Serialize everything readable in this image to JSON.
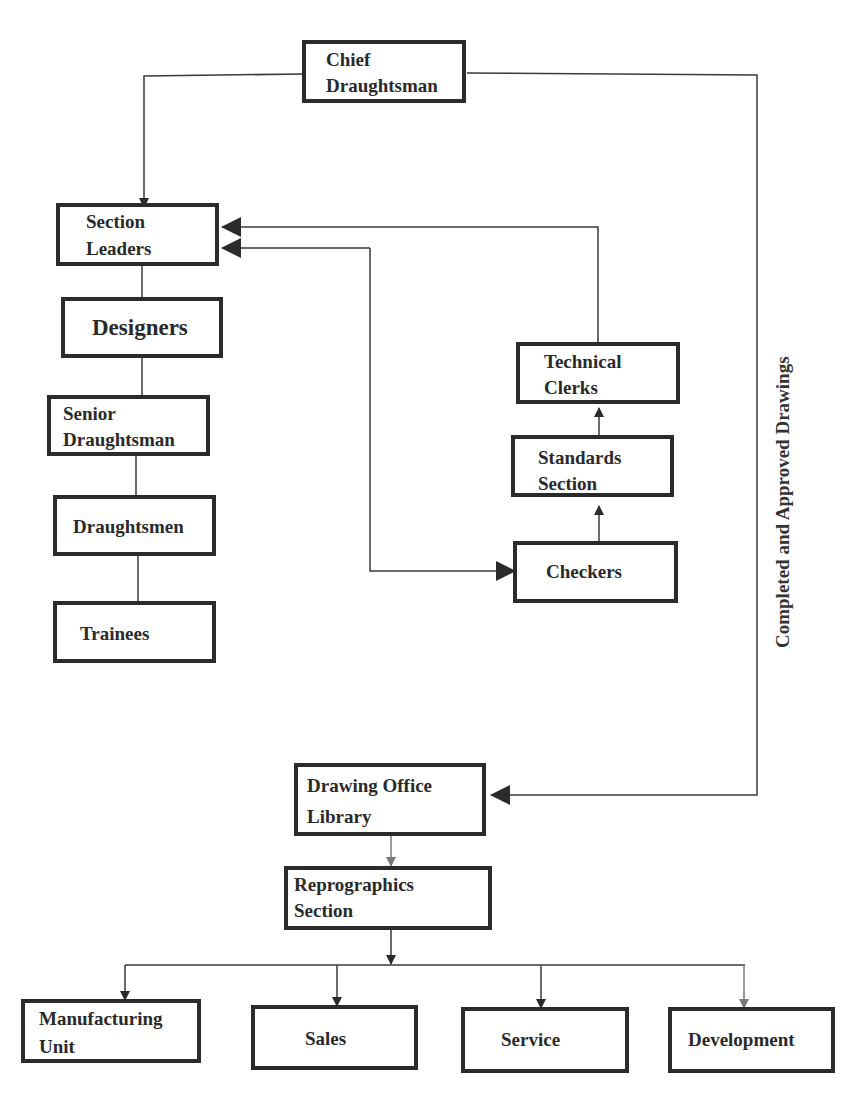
{
  "diagram": {
    "colors": {
      "line": "#3a3a3a",
      "border": "#2b2b2b",
      "gray_arrow": "#7a7a7a",
      "background": "#ffffff"
    },
    "nodes": {
      "chief": {
        "line1": "Chief",
        "line2": "Draughtsman"
      },
      "section_leaders": {
        "line1": "Section",
        "line2": "Leaders"
      },
      "designers": {
        "label": "Designers"
      },
      "senior": {
        "line1": "Senior",
        "line2": "Draughtsman"
      },
      "draughtsmen": {
        "label": "Draughtsmen"
      },
      "trainees": {
        "label": "Trainees"
      },
      "technical_clerks": {
        "line1": "Technical",
        "line2": "Clerks"
      },
      "standards": {
        "line1": "Standards",
        "line2": "Section"
      },
      "checkers": {
        "label": "Checkers"
      },
      "library": {
        "line1": "Drawing Office",
        "line2": "Library"
      },
      "reprographics": {
        "line1": "Reprographics",
        "line2": "Section"
      },
      "manufacturing": {
        "line1": "Manufacturing",
        "line2": "Unit"
      },
      "sales": {
        "label": "Sales"
      },
      "service": {
        "label": "Service"
      },
      "development": {
        "label": "Development"
      }
    },
    "edge_label": "Completed and Approved Drawings",
    "edges": [
      {
        "from": "Chief Draughtsman",
        "to": "Section Leaders"
      },
      {
        "from": "Chief Draughtsman",
        "to": "Drawing Office Library",
        "label": "Completed and Approved Drawings"
      },
      {
        "from": "Section Leaders",
        "to": "Designers"
      },
      {
        "from": "Designers",
        "to": "Senior Draughtsman"
      },
      {
        "from": "Senior Draughtsman",
        "to": "Draughtsmen"
      },
      {
        "from": "Draughtsmen",
        "to": "Trainees"
      },
      {
        "from": "Section Leaders",
        "to": "Checkers",
        "bidirectional": true
      },
      {
        "from": "Checkers",
        "to": "Standards Section"
      },
      {
        "from": "Standards Section",
        "to": "Technical Clerks"
      },
      {
        "from": "Technical Clerks",
        "to": "Section Leaders"
      },
      {
        "from": "Drawing Office Library",
        "to": "Reprographics Section"
      },
      {
        "from": "Reprographics Section",
        "to": "Manufacturing Unit"
      },
      {
        "from": "Reprographics Section",
        "to": "Sales"
      },
      {
        "from": "Reprographics Section",
        "to": "Service"
      },
      {
        "from": "Reprographics Section",
        "to": "Development"
      }
    ]
  }
}
